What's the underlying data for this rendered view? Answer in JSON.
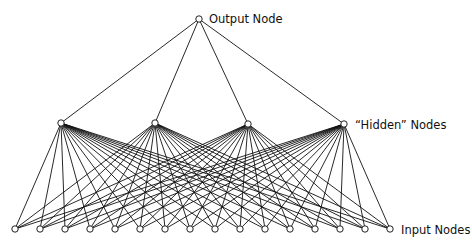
{
  "diagram": {
    "labels": {
      "output": "Output Node",
      "hidden": "“Hidden” Nodes",
      "input": "Input Nodes"
    },
    "colors": {
      "edge": "#111111",
      "node_fill": "#ffffff",
      "node_stroke": "#222222",
      "text": "#111111"
    },
    "layers": {
      "output": [
        {
          "x": 199,
          "y": 19
        }
      ],
      "hidden": [
        {
          "x": 61,
          "y": 123
        },
        {
          "x": 155,
          "y": 123
        },
        {
          "x": 248,
          "y": 124
        },
        {
          "x": 344,
          "y": 124
        }
      ],
      "input": [
        {
          "x": 15,
          "y": 229
        },
        {
          "x": 40,
          "y": 229
        },
        {
          "x": 65,
          "y": 229
        },
        {
          "x": 90,
          "y": 229
        },
        {
          "x": 115,
          "y": 229
        },
        {
          "x": 140,
          "y": 229
        },
        {
          "x": 165,
          "y": 229
        },
        {
          "x": 190,
          "y": 229
        },
        {
          "x": 215,
          "y": 229
        },
        {
          "x": 240,
          "y": 229
        },
        {
          "x": 265,
          "y": 229
        },
        {
          "x": 290,
          "y": 229
        },
        {
          "x": 315,
          "y": 229
        },
        {
          "x": 340,
          "y": 229
        },
        {
          "x": 365,
          "y": 229
        },
        {
          "x": 390,
          "y": 229
        }
      ]
    },
    "label_positions": {
      "output": {
        "x": 209,
        "y": 23
      },
      "hidden": {
        "x": 355,
        "y": 129
      },
      "input": {
        "x": 401,
        "y": 234
      }
    },
    "node_radius": 3.2
  }
}
